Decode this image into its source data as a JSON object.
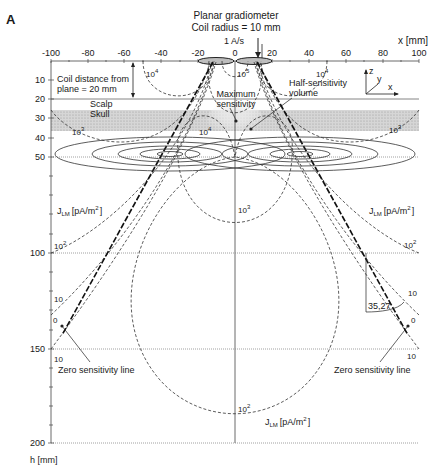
{
  "panel_label": "A",
  "title": {
    "line1": "Planar gradiometer",
    "line2": "Coil radius = 10 mm"
  },
  "current_label": "1 A/s",
  "x_axis": {
    "label": "x [mm]",
    "ticks": [
      "-100",
      "-80",
      "-60",
      "-40",
      "-20",
      "0",
      "20",
      "40",
      "60",
      "80",
      "100"
    ]
  },
  "y_axis": {
    "label": "h [mm]",
    "ticks": [
      "10",
      "20",
      "30",
      "40",
      "50",
      "100",
      "150",
      "200"
    ]
  },
  "annotations": {
    "coil_distance_1": "Coil distance from",
    "coil_distance_2": "plane = 20 mm",
    "scalp": "Scalp",
    "skull": "Skull",
    "max_sens_1": "Maximum",
    "max_sens_2": "sensitivity",
    "half_sens_1": "Half-sensitivity",
    "half_sens_2": "volume",
    "angle": "35,27",
    "zero_line_left": "Zero sensitivity line",
    "zero_line_right": "Zero sensitivity line",
    "jlm_unit": "[pA/m",
    "jlm_sup": "2",
    "jlm_close": "]",
    "jlm_J": "J",
    "jlm_sub": "LM"
  },
  "contour_labels": {
    "e4_left": "10",
    "e4_right": "10",
    "e5_center": "10",
    "e4_center": "10",
    "e3_left": "10",
    "e3_right": "10",
    "e3_center": "10",
    "e2_left": "10",
    "e2_right": "10",
    "e2_bottom": "10",
    "ten_left": "10",
    "ten_right": "10",
    "zero_left": "0",
    "zero_right": "0",
    "ten_bl": "10",
    "ten_br": "10",
    "sup4": "4",
    "sup5": "5",
    "sup3": "3",
    "sup2": "2"
  },
  "coordinate_system": {
    "z": "z",
    "y": "y",
    "x": "x"
  }
}
